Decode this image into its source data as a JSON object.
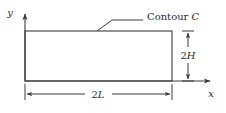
{
  "figure": {
    "type": "technical-diagram",
    "background_color": "#ffffff",
    "line_color": "#3a3a3a",
    "text_color": "#2b2b2b"
  },
  "axes": {
    "y_axis": {
      "label": "y",
      "origin_x": 25,
      "top_y": 12,
      "bottom_y": 81
    },
    "x_axis": {
      "label": "x",
      "origin_y": 81,
      "left_x": 25,
      "right_x": 212
    }
  },
  "contour": {
    "callout_prefix": "Contour",
    "callout_symbol": "C",
    "rect": {
      "left": 25,
      "top": 31,
      "right": 172,
      "bottom": 81
    },
    "leader": {
      "text_end_x": 143,
      "horizontal_y": 20,
      "elbow_x": 112,
      "tip_x": 97,
      "tip_y": 31
    }
  },
  "dimensions": {
    "height": {
      "label_number": "2",
      "label_variable": "H",
      "line_x": 188,
      "top_y": 31,
      "bottom_y": 81,
      "tick_half_width": 6
    },
    "width": {
      "label_number": "2",
      "label_variable": "L",
      "line_y": 94,
      "left_x": 25,
      "right_x": 172,
      "tick_half_height": 6
    }
  }
}
